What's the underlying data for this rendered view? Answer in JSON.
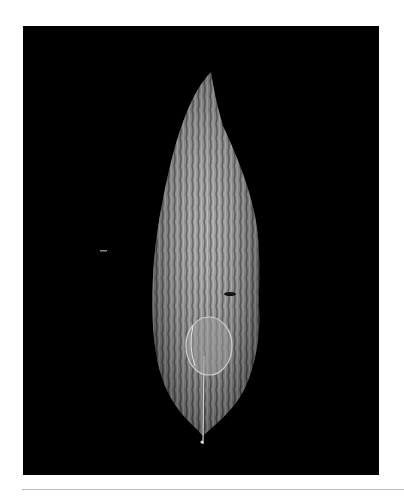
{
  "image": {
    "subject": "leaf",
    "background_color": "#000000",
    "border_color": "#ffffff",
    "leaf_color": "#9a9a9a",
    "rule_color": "#bdbdbd"
  }
}
